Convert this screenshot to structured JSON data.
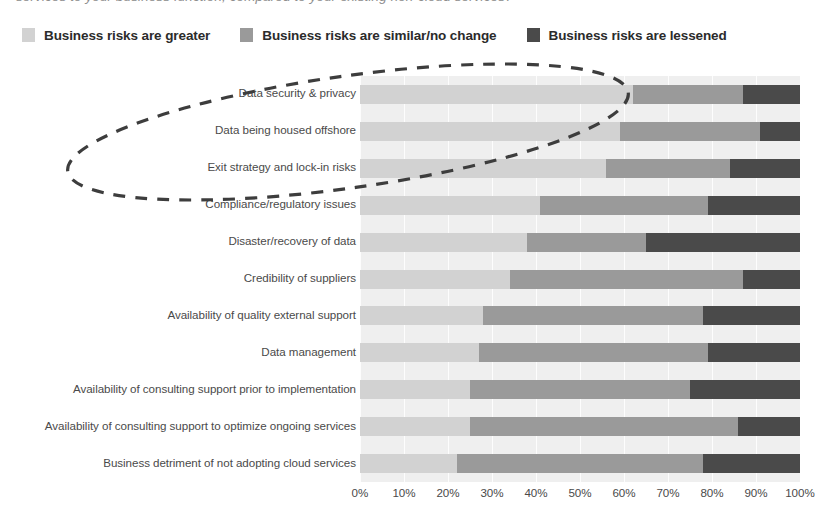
{
  "caption": {
    "text": "services to your business function, compared to your existing non-cloud services?"
  },
  "legend": {
    "items": [
      {
        "label": "Business risks are greater",
        "color": "#d2d2d2",
        "icon": "legend-swatch-light"
      },
      {
        "label": "Business risks are similar/no change",
        "color": "#9a9a9a",
        "icon": "legend-swatch-medium"
      },
      {
        "label": "Business risks are lessened",
        "color": "#4a4a4a",
        "icon": "legend-swatch-dark"
      }
    ]
  },
  "annotation": {
    "name": "dashed-ellipse-highlight",
    "style": "dashed",
    "color": "#3d3d3d",
    "highlights": [
      "Data security & privacy",
      "Data being housed offshore",
      "Exit strategy and lock-in risks"
    ]
  },
  "chart_data": {
    "type": "bar",
    "orientation": "horizontal",
    "stacked": true,
    "stacked_percent": true,
    "title": "",
    "subtitle": "",
    "xlabel": "",
    "ylabel": "",
    "xlim": [
      0,
      100
    ],
    "grid": true,
    "legend_position": "top-left",
    "xticks": [
      "0%",
      "10%",
      "20%",
      "30%",
      "40%",
      "50%",
      "60%",
      "70%",
      "80%",
      "90%",
      "100%"
    ],
    "xtick_values": [
      0,
      10,
      20,
      30,
      40,
      50,
      60,
      70,
      80,
      90,
      100
    ],
    "categories": [
      "Data security & privacy",
      "Data being housed offshore",
      "Exit strategy and lock-in risks",
      "Compliance/regulatory issues",
      "Disaster/recovery of data",
      "Credibility of suppliers",
      "Availability of quality external support",
      "Data management",
      "Availability of consulting support prior to implementation",
      "Availability of consulting support to optimize ongoing services",
      "Business detriment of not adopting cloud services"
    ],
    "series": [
      {
        "name": "Business risks are greater",
        "color": "#d2d2d2",
        "values": [
          62,
          59,
          56,
          41,
          38,
          34,
          28,
          27,
          25,
          25,
          22
        ]
      },
      {
        "name": "Business risks are similar/no change",
        "color": "#9a9a9a",
        "values": [
          25,
          32,
          28,
          38,
          27,
          53,
          50,
          52,
          50,
          61,
          56
        ]
      },
      {
        "name": "Business risks are lessened",
        "color": "#4a4a4a",
        "values": [
          13,
          9,
          16,
          21,
          35,
          13,
          22,
          21,
          25,
          14,
          22
        ]
      }
    ]
  }
}
